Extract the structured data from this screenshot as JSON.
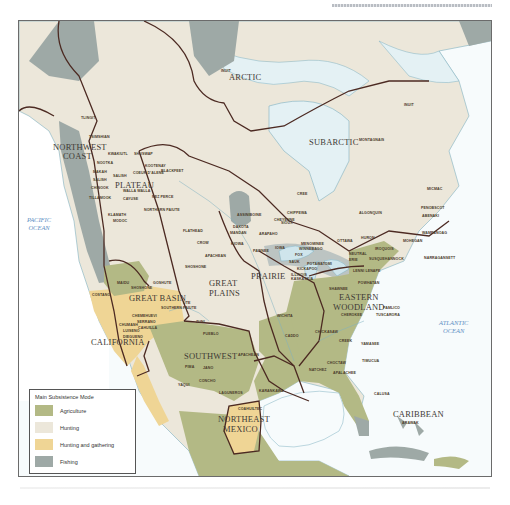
{
  "colors": {
    "agriculture": "#b3b985",
    "hunting": "#ece7da",
    "hunting_gathering": "#efd595",
    "fishing": "#9ea9a6",
    "water": "#dcedf1",
    "boundary": "#4c2a22"
  },
  "oceans": {
    "pacific": "PACIFIC\nOCEAN",
    "atlantic": "ATLANTIC\nOCEAN"
  },
  "regions": {
    "arctic": "ARCTIC",
    "subarctic": "SUBARCTIC",
    "northwest_coast_1": "NORTHWEST",
    "northwest_coast_2": "COAST",
    "plateau": "PLATEAU",
    "great_basin": "GREAT BASIN",
    "california": "CALIFORNIA",
    "great_plains_1": "GREAT",
    "great_plains_2": "PLAINS",
    "prairie": "PRAIRIE",
    "southwest": "SOUTHWEST",
    "eastern_woodland_1": "EASTERN",
    "eastern_woodland_2": "WOODLAND",
    "northeast_mexico_1": "NORTHEAST",
    "northeast_mexico_2": "MEXICO",
    "caribbean": "CARIBBEAN"
  },
  "tribes": {
    "inuit_w": "INUIT",
    "inuit_e": "INUIT",
    "tlingit": "TLINGIT",
    "tsimshian": "TSIMSHIAN",
    "kwakiutl": "KWAKIUTL",
    "shuswap": "SHUSWAP",
    "nootka": "NOOTKA",
    "makah": "MAKAH",
    "salish": "SALISH",
    "chinook": "CHINOOK",
    "tillamook": "TILLAMOOK",
    "kootenay": "KOOTENAY",
    "blackfeet": "BLACKFEET",
    "coeur": "COEUR D'ALENE",
    "walla": "WALLA WALLA",
    "cayuse": "CAYUSE",
    "nez_perce": "NEZ PERCE",
    "northern_paiute": "NORTHERN PAIUTE",
    "klamath": "KLAMATH",
    "modoc": "MODOC",
    "maidu": "MAIDU",
    "costano": "COSTANO",
    "shoshone_gb": "SHOSHONE",
    "goshute": "GOSHUTE",
    "southern_paiute": "SOUTHERN PAIUTE",
    "chemehuevi": "CHEMEHUEVI",
    "serrano": "SERRANO",
    "cahuilla": "CAHUILLA",
    "chumash": "CHUMASH",
    "luiseno": "LUISENO",
    "diegueno": "DIEGUENO",
    "flathead": "FLATHEAD",
    "crow": "CROW",
    "apachean_n": "APACHEAN",
    "shoshone_p": "SHOSHONE",
    "assiniboine": "ASSINIBOINE",
    "cheyenne": "CHEYENNE",
    "dakota": "DAKOTA",
    "mandan": "MANDAN",
    "arapaho": "ARAPAHO",
    "kiowa": "KIOWA",
    "pawnee": "PAWNEE",
    "iowa": "IOWA",
    "sauk": "SAUK",
    "fox": "FOX",
    "kickapoo": "KICKAPOO",
    "illinois": "ILLINOIS",
    "kaskaskia": "KASKASKIA",
    "wichita": "WICHITA",
    "caddo": "CADDO",
    "apachean_s": "APACHEAN",
    "ute": "UTE",
    "zuni": "ZUNI",
    "pueblo": "PUEBLO",
    "pima": "PIMA",
    "jano": "JANO",
    "yaqui": "YAQUI",
    "concho": "CONCHO",
    "laguneros": "LAGUNEROS",
    "coahuiltec": "COAHUILTEC",
    "karankawa": "KARANKAWA",
    "cree": "CREE",
    "chippewa": "CHIPPEWA",
    "sioux": "SIOUX",
    "montagnais": "MONTAGNAIS",
    "micmac": "MICMAC",
    "algonquin": "ALGONQUIN",
    "penobscot": "PENOBSCOT",
    "abenaki": "ABENAKI",
    "ottawa": "OTTAWA",
    "huron": "HURON",
    "menominee": "MENOMINEE",
    "winnebago": "WINNEBAGO",
    "potawatomi": "POTAWATOMI",
    "neutral": "NEUTRAL",
    "erie": "ERIE",
    "iroquois": "IROQUOIS",
    "mohegan": "MOHEGAN",
    "wampanoag": "WAMPANOAG",
    "narragansett": "NARRAGANSETT",
    "susquehannock": "SUSQUEHANNOCK",
    "lenni_lenape": "LENNI LENAPE",
    "shawnee": "SHAWNEE",
    "powhatan": "POWHATAN",
    "cherokee": "CHEROKEE",
    "pamlico": "PAMLICO",
    "tuscarora": "TUSCARORA",
    "chickasaw": "CHICKASAW",
    "creek": "CREEK",
    "choctaw": "CHOCTAW",
    "natchez": "NATCHEZ",
    "apalachee": "APALACHEE",
    "yamasee": "YAMASEE",
    "timucua": "TIMUCUA",
    "calusa": "CALUSA",
    "arawak": "ARAWAK"
  },
  "legend": {
    "title": "Main Subsistence Mode",
    "items": [
      {
        "label": "Agriculture",
        "color": "#b3b985"
      },
      {
        "label": "Hunting",
        "color": "#ece7da"
      },
      {
        "label": "Hunting and gathering",
        "color": "#efd595"
      },
      {
        "label": "Fishing",
        "color": "#9ea9a6"
      }
    ]
  }
}
